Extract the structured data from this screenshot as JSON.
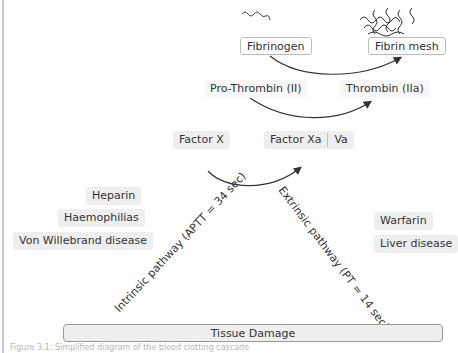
{
  "diagram": {
    "nodes": {
      "fibrinogen": "Fibrinogen",
      "fibrin_mesh": "Fibrin mesh",
      "prothrombin": "Pro-Thrombin (II)",
      "thrombin": "Thrombin (IIa)",
      "factor_x": "Factor X",
      "factor_xa": "Factor Xa",
      "va": "Va"
    },
    "pathways": {
      "intrinsic": "Intrinsic pathway (APTT = 34 sec)",
      "extrinsic": "Extrinsic pathway (PT = 14 sec)"
    },
    "intrinsic_factors": [
      "Heparin",
      "Haemophilias",
      "Von Willebrand disease"
    ],
    "extrinsic_factors": [
      "Warfarin",
      "Liver disease"
    ],
    "base": "Tissue Damage",
    "caption": "Figure 3.1: Simplified diagram of the blood clotting cascade"
  },
  "colors": {
    "arrow": "#333333",
    "chip_bg": "#eeeeee",
    "box_border": "#bdbdbd"
  }
}
